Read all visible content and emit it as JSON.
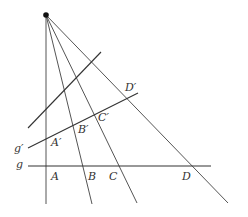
{
  "diagram": {
    "center": {
      "x": 46,
      "y": 15
    },
    "rays": [
      {
        "name": "ray-A",
        "x1": 46,
        "y1": 15,
        "x2": 46,
        "y2": 204
      },
      {
        "name": "ray-B",
        "x1": 46,
        "y1": 15,
        "x2": 92,
        "y2": 204
      },
      {
        "name": "ray-C",
        "x1": 46,
        "y1": 15,
        "x2": 137,
        "y2": 203
      },
      {
        "name": "ray-D",
        "x1": 46,
        "y1": 15,
        "x2": 228,
        "y2": 203
      }
    ],
    "lines": [
      {
        "name": "line-g",
        "x1": 28,
        "y1": 166,
        "x2": 211,
        "y2": 166
      },
      {
        "name": "line-g-prime",
        "x1": 28,
        "y1": 148,
        "x2": 138,
        "y2": 93
      },
      {
        "name": "line-upper",
        "x1": 28,
        "y1": 128,
        "x2": 101,
        "y2": 52
      }
    ],
    "labels": {
      "g": "g",
      "g_prime": "g′",
      "A": "A",
      "B": "B",
      "C": "C",
      "D": "D",
      "A_prime": "A′",
      "B_prime": "B′",
      "C_prime": "C′",
      "D_prime": "D′"
    },
    "colors": {
      "ink": "#333333",
      "ray": "#555555",
      "background": "#ffffff"
    }
  }
}
